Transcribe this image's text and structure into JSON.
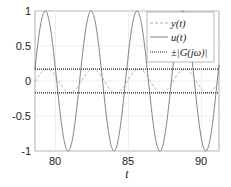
{
  "chart_data": {
    "type": "line",
    "title": "",
    "xlabel": "t",
    "ylabel": "",
    "xlim": [
      78.6,
      91.2
    ],
    "ylim": [
      -1,
      1
    ],
    "xticks": [
      80,
      85,
      90
    ],
    "yticks": [
      1,
      0.5,
      0,
      -0.5,
      -1
    ],
    "ytick_labels": [
      "1",
      "0.5",
      "0",
      "-0.5",
      "-1"
    ],
    "xtick_labels": [
      "80",
      "85",
      "90"
    ],
    "grid": true,
    "legend_position": "upper right",
    "series": [
      {
        "name": "y(t)",
        "style": "dashed",
        "color": "#aaaaaa",
        "amplitude": 0.17,
        "omega": 2,
        "description": "sinusoid, amplitude ~0.17, slightly lagging u(t)"
      },
      {
        "name": "u(t)",
        "style": "solid",
        "color": "#666666",
        "amplitude": 1.0,
        "omega": 2,
        "description": "sinusoid, amplitude 1, peaks near t≈79.3, 82.4, 85.6, 88.7"
      },
      {
        "name": "±|G(jω)|",
        "style": "dotted",
        "color": "#222222",
        "values": [
          0.17,
          -0.17
        ],
        "description": "horizontal lines at ±0.17"
      }
    ]
  },
  "legend": {
    "y_label": "y(t)",
    "u_label": "u(t)",
    "g_label": "±|G(jω)|"
  },
  "axes": {
    "xlabel": "t",
    "xticks": [
      "80",
      "85",
      "90"
    ],
    "yticks": [
      "1",
      "0.5",
      "0",
      "-0.5",
      "-1"
    ]
  }
}
